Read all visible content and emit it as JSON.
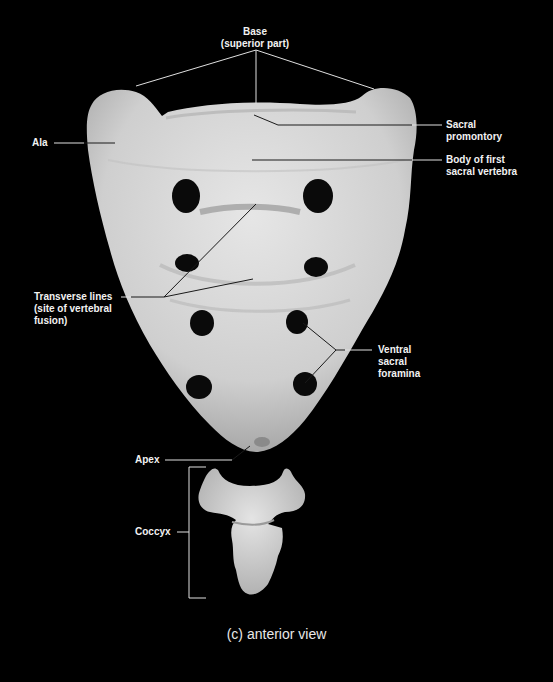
{
  "figure": {
    "caption": "(c) anterior view",
    "colors": {
      "background": "#000000",
      "bone": "#d9d9d9",
      "foramen": "#0a0a0a",
      "label_text": "#f2f2f2",
      "leader_line_on_black": "#e0e0e0",
      "leader_line_on_bone": "#1a1a1a"
    }
  },
  "labels": {
    "base": "Base\n(superior part)",
    "sacral_promontory": "Sacral\npromontory",
    "body_first_sacral": "Body of first\nsacral vertebra",
    "ala": "Ala",
    "transverse_lines": "Transverse lines\n(site of vertebral\nfusion)",
    "ventral_sacral_foramina": "Ventral\nsacral\nforamina",
    "apex": "Apex",
    "coccyx": "Coccyx"
  }
}
